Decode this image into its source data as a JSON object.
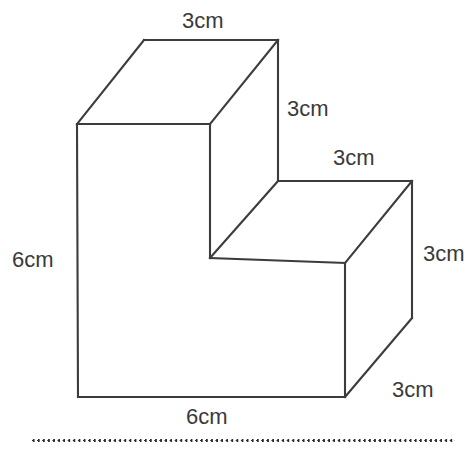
{
  "figure": {
    "shape_type": "3d-isometric-step-solid",
    "stroke_color": "#3c3c3c",
    "face_color": "#ffffff",
    "label_color": "#3a3a3a",
    "labels": {
      "top_back": "3cm",
      "tall_block_right_height": "3cm",
      "step_top_depth": "3cm",
      "step_right_height": "3cm",
      "base_depth": "3cm",
      "left_height": "6cm",
      "front_width": "6cm"
    },
    "geometry": {
      "units": "cm",
      "top_back_left": [
        144,
        40
      ],
      "top_back_right": [
        278,
        40
      ],
      "front_top_left": [
        77,
        124
      ],
      "front_top_right": [
        210,
        124
      ],
      "step_back_left": [
        278,
        181
      ],
      "step_back_right": [
        412,
        181
      ],
      "step_front_inner": [
        210,
        258
      ],
      "step_front_right": [
        345,
        263
      ],
      "right_back_bottom": [
        412,
        318
      ],
      "bottom_left": [
        78,
        397
      ],
      "bottom_right": [
        345,
        397
      ]
    }
  },
  "divider": {
    "style": "dotted",
    "name": "dotted-horizontal-rule"
  }
}
